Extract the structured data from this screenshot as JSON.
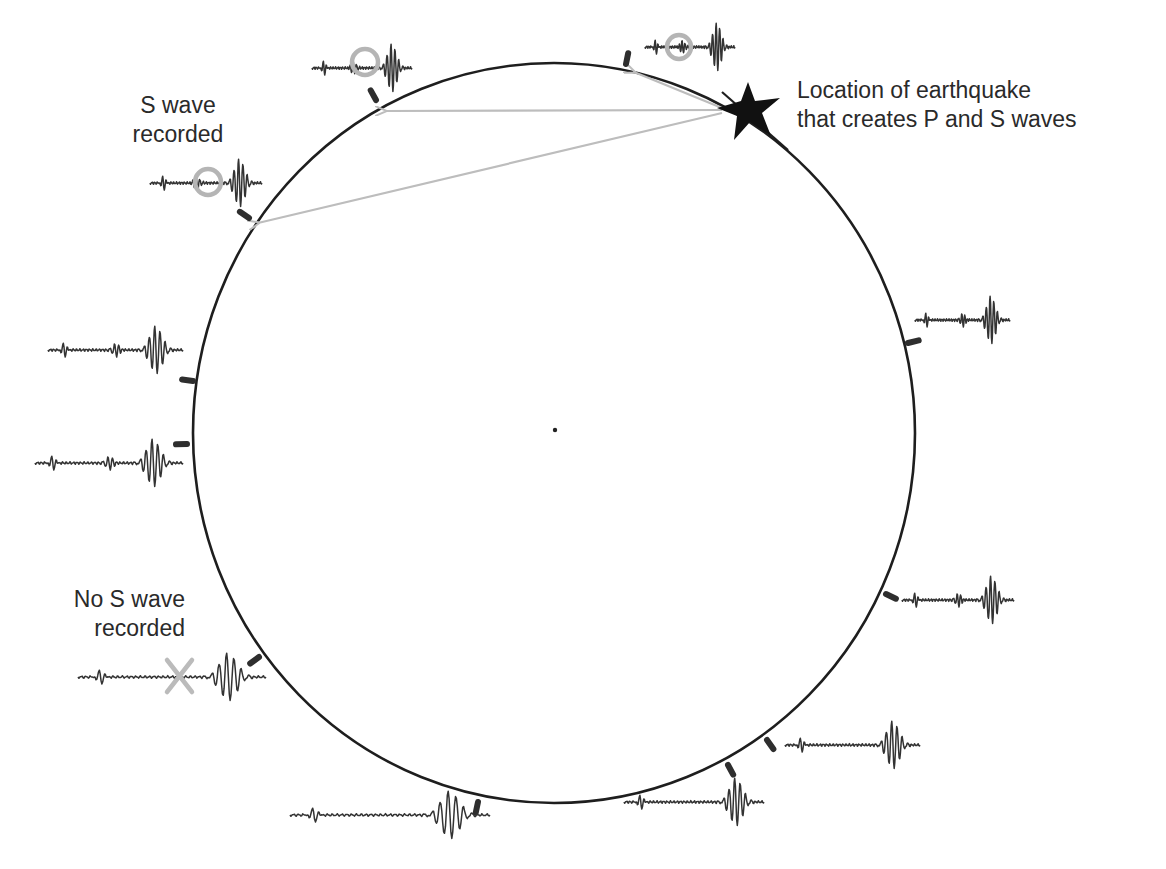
{
  "diagram": {
    "colors": {
      "earth_outline": "#1e1e1e",
      "station_marker": "#2e2e2e",
      "seismogram": "#333333",
      "ray_arrow": "#bdbdbd",
      "s_wave_circle": "#b5b5b5",
      "no_s_wave_x": "#bbbbbb",
      "epicenter_star": "#111111",
      "label_text": "#2a2a2a"
    },
    "earth": {
      "cx": 554,
      "cy": 433,
      "rx": 361,
      "ry": 370,
      "center_dot": true
    },
    "epicenter": {
      "x": 748,
      "y": 108,
      "icon": "star-icon"
    },
    "labels": {
      "epicenter": {
        "line1": "Location of earthquake",
        "line2": "that creates P and S waves"
      },
      "s_wave_recorded": {
        "line1": "S wave",
        "line2": "recorded"
      },
      "no_s_wave": {
        "line1": "No S wave",
        "line2": "recorded"
      }
    },
    "stations": [
      {
        "id": "st-1",
        "x": 626,
        "y": 64,
        "angle": -6,
        "s_wave": "recorded",
        "trace_x": 645,
        "trace_y": 47,
        "trace_w": 90,
        "ray": true
      },
      {
        "id": "st-2",
        "x": 376,
        "y": 100,
        "angle": 28,
        "s_wave": "recorded",
        "trace_x": 312,
        "trace_y": 68,
        "trace_w": 100,
        "ray": true
      },
      {
        "id": "st-3",
        "x": 249,
        "y": 218,
        "angle": 52,
        "s_wave": "recorded",
        "trace_x": 150,
        "trace_y": 183,
        "trace_w": 112,
        "ray": true
      },
      {
        "id": "st-4",
        "x": 193,
        "y": 381,
        "angle": 80,
        "s_wave": "present",
        "trace_x": 48,
        "trace_y": 350,
        "trace_w": 135,
        "ray": false
      },
      {
        "id": "st-5",
        "x": 187,
        "y": 444,
        "angle": 88,
        "s_wave": "present",
        "trace_x": 35,
        "trace_y": 463,
        "trace_w": 148,
        "ray": false
      },
      {
        "id": "st-6",
        "x": 259,
        "y": 657,
        "angle": 122,
        "s_wave": "absent",
        "trace_x": 78,
        "trace_y": 677,
        "trace_w": 188,
        "ray": false
      },
      {
        "id": "st-7",
        "x": 478,
        "y": 802,
        "angle": 165,
        "s_wave": "absent",
        "trace_x": 290,
        "trace_y": 815,
        "trace_w": 200,
        "ray": false
      },
      {
        "id": "st-8",
        "x": 728,
        "y": 765,
        "angle": 203,
        "s_wave": "absent",
        "trace_x": 624,
        "trace_y": 802,
        "trace_w": 140,
        "ray": false
      },
      {
        "id": "st-9",
        "x": 767,
        "y": 740,
        "angle": 212,
        "s_wave": "absent",
        "trace_x": 785,
        "trace_y": 745,
        "trace_w": 135,
        "ray": false
      },
      {
        "id": "st-10",
        "x": 886,
        "y": 594,
        "angle": 240,
        "s_wave": "present",
        "trace_x": 902,
        "trace_y": 600,
        "trace_w": 112,
        "ray": false
      },
      {
        "id": "st-11",
        "x": 908,
        "y": 343,
        "angle": 282,
        "s_wave": "present",
        "trace_x": 915,
        "trace_y": 320,
        "trace_w": 95,
        "ray": false
      }
    ],
    "annotations": {
      "s_wave_circle": "circle highlighting the S-wave arrival on near stations",
      "no_s_wave_mark": "X marking the missing S-wave arrival"
    }
  }
}
